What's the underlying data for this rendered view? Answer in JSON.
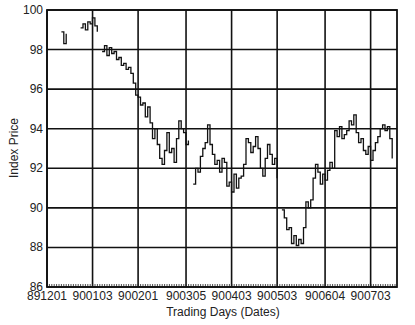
{
  "chart_data": {
    "type": "line",
    "title": "",
    "xlabel": "Trading Days (Dates)",
    "ylabel": "Index Price",
    "ylim": [
      86,
      100
    ],
    "yticks": [
      86,
      88,
      90,
      92,
      94,
      96,
      98,
      100
    ],
    "xticks": [
      "891201",
      "900103",
      "900201",
      "900305",
      "900403",
      "900503",
      "900604",
      "900703"
    ],
    "grid": true,
    "legend": "none",
    "series": [
      {
        "name": "Index Price",
        "points": [
          [
            0,
            98.7
          ],
          [
            2,
            98.8
          ],
          [
            4,
            98.6
          ],
          [
            6,
            98.9
          ],
          [
            7,
            98.3
          ],
          [
            8,
            98.8
          ],
          [
            10,
            98.8
          ],
          [
            12,
            98.9
          ],
          [
            14,
            99.1
          ],
          [
            15,
            99.3
          ],
          [
            16,
            99.0
          ],
          [
            17,
            99.4
          ],
          [
            18,
            99.3
          ],
          [
            19,
            99.6
          ],
          [
            20,
            99.2
          ],
          [
            21,
            98.9
          ],
          [
            23,
            97.9
          ],
          [
            24,
            98.2
          ],
          [
            25,
            97.7
          ],
          [
            26,
            98.1
          ],
          [
            27,
            97.8
          ],
          [
            28,
            97.9
          ],
          [
            29,
            97.5
          ],
          [
            30,
            97.6
          ],
          [
            31,
            97.2
          ],
          [
            32,
            97.3
          ],
          [
            33,
            97.0
          ],
          [
            34,
            97.1
          ],
          [
            35,
            96.8
          ],
          [
            36,
            96.3
          ],
          [
            37,
            95.7
          ],
          [
            38,
            95.6
          ],
          [
            39,
            95.2
          ],
          [
            40,
            95.3
          ],
          [
            41,
            94.6
          ],
          [
            42,
            95.1
          ],
          [
            43,
            94.3
          ],
          [
            44,
            93.5
          ],
          [
            45,
            94.0
          ],
          [
            46,
            93.2
          ],
          [
            47,
            92.5
          ],
          [
            48,
            92.2
          ],
          [
            49,
            92.9
          ],
          [
            50,
            93.8
          ],
          [
            51,
            92.8
          ],
          [
            52,
            93.0
          ],
          [
            53,
            92.3
          ],
          [
            54,
            93.5
          ],
          [
            55,
            94.4
          ],
          [
            56,
            94.0
          ],
          [
            57,
            93.8
          ],
          [
            58,
            93.2
          ],
          [
            59,
            93.4
          ],
          [
            61,
            91.2
          ],
          [
            62,
            92.0
          ],
          [
            63,
            91.8
          ],
          [
            64,
            92.6
          ],
          [
            65,
            93.0
          ],
          [
            66,
            93.3
          ],
          [
            67,
            94.2
          ],
          [
            68,
            93.2
          ],
          [
            69,
            92.7
          ],
          [
            70,
            92.2
          ],
          [
            71,
            92.4
          ],
          [
            72,
            91.8
          ],
          [
            73,
            92.5
          ],
          [
            74,
            92.3
          ],
          [
            75,
            91.1
          ],
          [
            76,
            91.3
          ],
          [
            77,
            90.8
          ],
          [
            78,
            91.7
          ],
          [
            79,
            91.0
          ],
          [
            80,
            91.5
          ],
          [
            81,
            91.6
          ],
          [
            82,
            92.2
          ],
          [
            83,
            93.5
          ],
          [
            84,
            93.3
          ],
          [
            85,
            92.8
          ],
          [
            86,
            93.1
          ],
          [
            87,
            93.6
          ],
          [
            88,
            93.0
          ],
          [
            89,
            92.0
          ],
          [
            90,
            91.6
          ],
          [
            91,
            92.5
          ],
          [
            92,
            93.2
          ],
          [
            93,
            92.7
          ],
          [
            94,
            92.2
          ],
          [
            95,
            92.5
          ],
          [
            96,
            91.5
          ],
          [
            98,
            89.9
          ],
          [
            99,
            89.5
          ],
          [
            100,
            88.9
          ],
          [
            101,
            89.0
          ],
          [
            102,
            88.2
          ],
          [
            103,
            88.6
          ],
          [
            104,
            88.1
          ],
          [
            105,
            88.4
          ],
          [
            106,
            88.2
          ],
          [
            107,
            89.0
          ],
          [
            108,
            90.3
          ],
          [
            109,
            90.0
          ],
          [
            110,
            90.4
          ],
          [
            111,
            91.5
          ],
          [
            112,
            92.2
          ],
          [
            113,
            91.8
          ],
          [
            114,
            91.2
          ],
          [
            115,
            91.7
          ],
          [
            116,
            91.4
          ],
          [
            117,
            91.9
          ],
          [
            118,
            92.3
          ],
          [
            119,
            92.0
          ],
          [
            120,
            93.9
          ],
          [
            121,
            93.6
          ],
          [
            122,
            94.1
          ],
          [
            123,
            93.5
          ],
          [
            124,
            93.7
          ],
          [
            125,
            93.9
          ],
          [
            126,
            94.4
          ],
          [
            127,
            94.2
          ],
          [
            128,
            94.7
          ],
          [
            129,
            93.8
          ],
          [
            130,
            93.3
          ],
          [
            131,
            93.5
          ],
          [
            132,
            92.9
          ],
          [
            133,
            92.7
          ],
          [
            134,
            93.1
          ],
          [
            135,
            92.4
          ],
          [
            136,
            92.9
          ],
          [
            137,
            93.3
          ],
          [
            138,
            93.6
          ],
          [
            139,
            94.0
          ],
          [
            140,
            94.2
          ],
          [
            141,
            93.9
          ],
          [
            142,
            94.1
          ],
          [
            143,
            93.5
          ],
          [
            144,
            92.5
          ]
        ]
      }
    ],
    "x_range": [
      0,
      146
    ],
    "x_tick_positions": [
      0,
      19,
      38,
      58,
      77,
      96,
      116,
      135
    ]
  }
}
